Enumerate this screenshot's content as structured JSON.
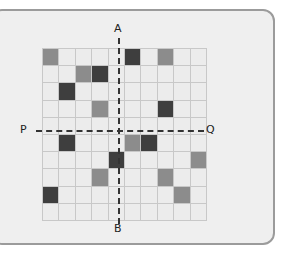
{
  "labels": {
    "top": "A",
    "bottom": "B",
    "left": "P",
    "right": "Q"
  },
  "grid": {
    "rows": 10,
    "cols": 10,
    "colors": {
      "empty": "#ececec",
      "mid": "#8c8c8c",
      "dark": "#3e3e3e",
      "line": "#c8c8c8"
    },
    "cells": [
      [
        "mid",
        "",
        "",
        "",
        "",
        "dark",
        "",
        "mid",
        "",
        ""
      ],
      [
        "",
        "",
        "mid",
        "dark",
        "",
        "",
        "",
        "",
        "",
        ""
      ],
      [
        "",
        "dark",
        "",
        "",
        "",
        "",
        "",
        "",
        "",
        ""
      ],
      [
        "",
        "",
        "",
        "mid",
        "",
        "",
        "",
        "dark",
        "",
        ""
      ],
      [
        "",
        "",
        "",
        "",
        "",
        "",
        "",
        "",
        "",
        ""
      ],
      [
        "",
        "dark",
        "",
        "",
        "",
        "mid",
        "dark",
        "",
        "",
        ""
      ],
      [
        "",
        "",
        "",
        "",
        "dark",
        "",
        "",
        "",
        "",
        "mid"
      ],
      [
        "",
        "",
        "",
        "mid",
        "",
        "",
        "",
        "mid",
        "",
        ""
      ],
      [
        "dark",
        "",
        "",
        "",
        "",
        "",
        "",
        "",
        "mid",
        ""
      ],
      [
        "",
        "",
        "",
        "",
        "",
        "",
        "",
        "",
        "",
        ""
      ]
    ]
  }
}
